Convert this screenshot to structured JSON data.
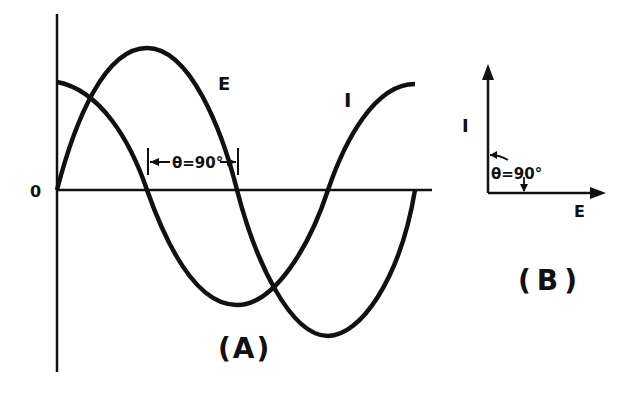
{
  "diagram": {
    "panel_a": {
      "caption": "(A)",
      "origin_label": "0",
      "curves": [
        {
          "name": "E",
          "label": "E",
          "type": "sine",
          "phase_deg": 0
        },
        {
          "name": "I",
          "label": "I",
          "type": "cosine",
          "phase_deg": 90
        }
      ],
      "phase_annotation": "θ=90°"
    },
    "panel_b": {
      "caption": "(B)",
      "vectors": [
        {
          "name": "I",
          "label": "I",
          "direction": "vertical"
        },
        {
          "name": "E",
          "label": "E",
          "direction": "horizontal"
        }
      ],
      "angle_annotation": "θ=90°"
    },
    "colors": {
      "ink": "#111111",
      "background": "#ffffff"
    }
  }
}
